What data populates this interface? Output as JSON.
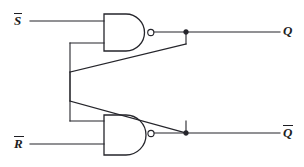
{
  "diagram": {
    "type": "logic-circuit-schematic",
    "stroke_color": "#25252b",
    "background_color": "#ffffff",
    "labels": {
      "input_set": "S",
      "input_set_overbar": true,
      "input_reset": "R",
      "input_reset_overbar": true,
      "output_q": "Q",
      "output_q_overbar": false,
      "output_qbar": "Q",
      "output_qbar_overbar": true
    },
    "gates": [
      {
        "id": "nand-top",
        "type": "NAND",
        "inputs": [
          "S-bar",
          "feedback-from-Q-bar"
        ],
        "output": "Q",
        "inverter_bubble": true
      },
      {
        "id": "nand-bottom",
        "type": "NAND",
        "inputs": [
          "feedback-from-Q",
          "R-bar"
        ],
        "output": "Q-bar",
        "inverter_bubble": true
      }
    ],
    "junction_count": 2,
    "cross_coupled": true
  }
}
